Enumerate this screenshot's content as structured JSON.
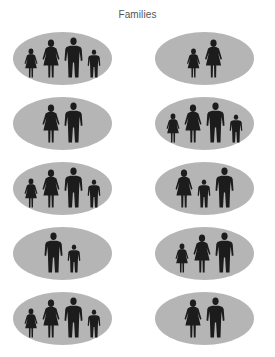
{
  "title": "Families",
  "colors": {
    "ellipse_fill": "#b5b5b5",
    "figure_fill": "#1c1c1c",
    "title_color": "#555555",
    "background": "#ffffff"
  },
  "legend": {
    "man": "adult male silhouette",
    "woman": "adult female silhouette (dress)",
    "boy": "child male silhouette",
    "girl": "child female silhouette (dress)"
  },
  "families": [
    {
      "row": 1,
      "column": "left",
      "members": [
        "girl",
        "woman",
        "man",
        "boy"
      ]
    },
    {
      "row": 1,
      "column": "right",
      "members": [
        "girl",
        "woman"
      ]
    },
    {
      "row": 2,
      "column": "left",
      "members": [
        "woman",
        "man"
      ]
    },
    {
      "row": 2,
      "column": "right",
      "members": [
        "girl",
        "woman",
        "man",
        "boy"
      ]
    },
    {
      "row": 3,
      "column": "left",
      "members": [
        "girl",
        "woman",
        "man",
        "boy"
      ]
    },
    {
      "row": 3,
      "column": "right",
      "members": [
        "woman",
        "boy",
        "man"
      ]
    },
    {
      "row": 4,
      "column": "left",
      "members": [
        "man",
        "boy"
      ]
    },
    {
      "row": 4,
      "column": "right",
      "members": [
        "girl",
        "woman",
        "man"
      ]
    },
    {
      "row": 5,
      "column": "left",
      "members": [
        "girl",
        "woman",
        "man",
        "boy"
      ]
    },
    {
      "row": 5,
      "column": "right",
      "members": [
        "woman",
        "man"
      ]
    }
  ]
}
